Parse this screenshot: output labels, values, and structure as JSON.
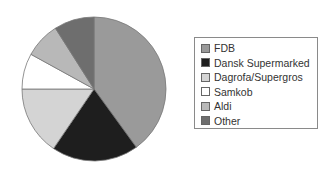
{
  "chart_data": {
    "type": "pie",
    "title": "",
    "categories": [
      "FDB",
      "Dansk Supermarked",
      "Dagrofa/Supergros",
      "Samkob",
      "Aldi",
      "Other"
    ],
    "values": [
      40,
      19.5,
      15.5,
      8,
      8,
      9
    ],
    "unit": "%",
    "colors": [
      "#9a9a9a",
      "#1e1e1e",
      "#d4d4d4",
      "#ffffff",
      "#b8b8b8",
      "#6e6e6e"
    ],
    "start_angle": "12 o'clock",
    "direction": "clockwise",
    "legend_position": "right"
  },
  "legend": {
    "items": [
      {
        "label": "FDB"
      },
      {
        "label": "Dansk Supermarked"
      },
      {
        "label": "Dagrofa/Supergros"
      },
      {
        "label": "Samkob"
      },
      {
        "label": "Aldi"
      },
      {
        "label": "Other"
      }
    ]
  }
}
